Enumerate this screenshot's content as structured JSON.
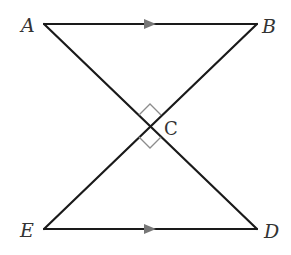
{
  "diagram": {
    "type": "geometry",
    "points": {
      "A": {
        "label": "A",
        "x": 44,
        "y": 24
      },
      "B": {
        "label": "B",
        "x": 257,
        "y": 24
      },
      "C": {
        "label": "C",
        "x": 150,
        "y": 126
      },
      "D": {
        "label": "D",
        "x": 257,
        "y": 229
      },
      "E": {
        "label": "E",
        "x": 44,
        "y": 229
      }
    },
    "segments": [
      "AB",
      "ED",
      "AD",
      "BE"
    ],
    "parallel_marks": [
      "AB",
      "ED"
    ],
    "right_angle_marks": [
      "ACB",
      "ECD"
    ],
    "colors": {
      "line": "#1a1a1a",
      "arrow": "#777777",
      "right_angle": "#8c8c8c",
      "label": "#333333"
    }
  }
}
